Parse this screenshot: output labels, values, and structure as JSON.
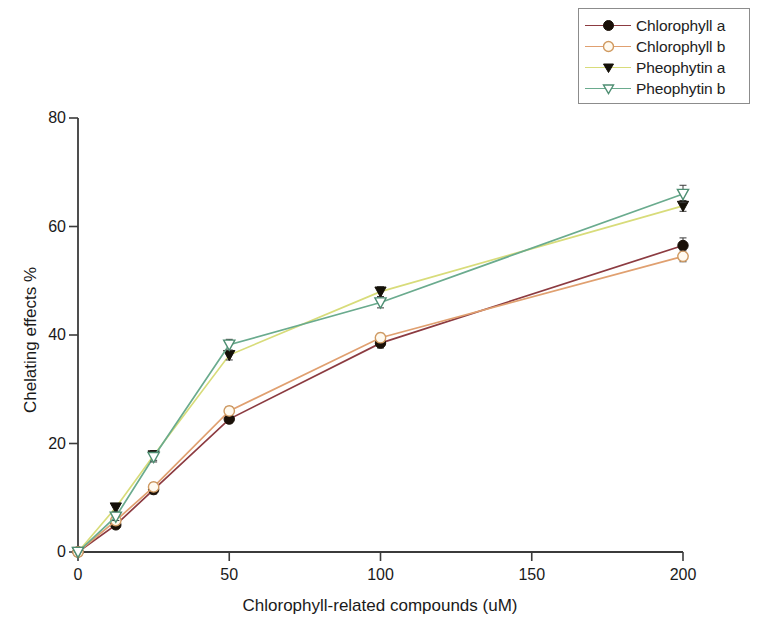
{
  "chart_data": {
    "type": "line",
    "title": "",
    "xlabel": "Chlorophyll-related compounds  (uM)",
    "ylabel": "Chelating effects %",
    "xlim": [
      0,
      200
    ],
    "ylim": [
      0,
      80
    ],
    "xticks": [
      0,
      50,
      100,
      150,
      200
    ],
    "yticks": [
      0,
      20,
      40,
      60,
      80
    ],
    "xtick_labels": [
      "0",
      "50",
      "100",
      "150",
      "200"
    ],
    "ytick_labels": [
      "0",
      "20",
      "40",
      "60",
      "80"
    ],
    "grid": false,
    "legend_position": "top-right",
    "x": [
      0,
      12.5,
      25,
      50,
      100,
      200
    ],
    "series": [
      {
        "name": "Chlorophyll a",
        "color": "#8c3b41",
        "marker": "filled-circle",
        "marker_color": "#1a1008",
        "values": [
          0,
          5.0,
          11.5,
          24.5,
          38.5,
          56.5
        ],
        "errors": [
          0,
          0.6,
          0.8,
          0.7,
          0.9,
          1.4
        ]
      },
      {
        "name": "Chlorophyll b",
        "color": "#e0a070",
        "marker": "open-circle",
        "marker_color": "#ffffff",
        "values": [
          0,
          5.8,
          12.0,
          26.0,
          39.5,
          54.5
        ],
        "errors": [
          0,
          0.6,
          0.8,
          0.8,
          0.8,
          1.0
        ]
      },
      {
        "name": "Pheophytin a",
        "color": "#d8dc7a",
        "marker": "filled-triangle-down",
        "marker_color": "#141008",
        "values": [
          0,
          8.2,
          17.8,
          36.3,
          48.0,
          63.8
        ],
        "errors": [
          0,
          0.7,
          0.9,
          0.9,
          0.9,
          1.0
        ]
      },
      {
        "name": "Pheophytin b",
        "color": "#6aab8e",
        "marker": "open-triangle-down",
        "marker_color": "#ffffff",
        "values": [
          0,
          6.5,
          17.5,
          38.2,
          46.0,
          66.0
        ],
        "errors": [
          0,
          0.7,
          0.9,
          1.0,
          1.0,
          1.6
        ]
      }
    ]
  },
  "axes": {
    "x_label": "Chlorophyll-related compounds  (uM)",
    "y_label": "Chelating effects %"
  },
  "legend": {
    "items": [
      {
        "label": "Chlorophyll a"
      },
      {
        "label": "Chlorophyll b"
      },
      {
        "label": "Pheophytin a"
      },
      {
        "label": "Pheophytin b"
      }
    ]
  }
}
